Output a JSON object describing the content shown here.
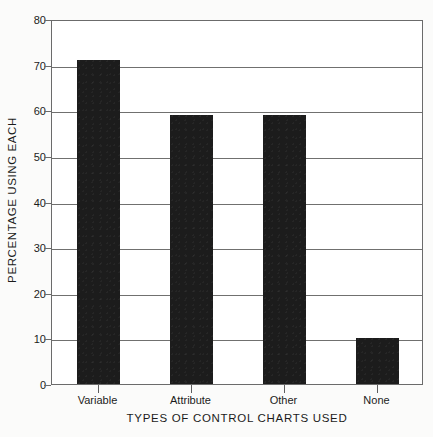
{
  "chart_data": {
    "type": "bar",
    "title": "",
    "subtitle": "",
    "categories": [
      "Variable",
      "Attribute",
      "Other",
      "None"
    ],
    "values": [
      71,
      59,
      59,
      10
    ],
    "xlabel": "TYPES OF CONTROL CHARTS USED",
    "ylabel": "PERCENTAGE USING EACH",
    "ylim": [
      0,
      80
    ],
    "ytick_labels": [
      "0",
      "10",
      "20",
      "30",
      "40",
      "50",
      "60",
      "70",
      "80"
    ],
    "ytick_values": [
      0,
      10,
      20,
      30,
      40,
      50,
      60,
      70,
      80
    ],
    "gridline_values": [
      10,
      20,
      30,
      40,
      50,
      60,
      70
    ],
    "grid": true,
    "legend": false,
    "legend_position": "none",
    "bar_color": "#1c1c1c",
    "grid_color": "#70706f",
    "axis_color": "#6b6b6b",
    "background_color": "#fbfbfa"
  }
}
